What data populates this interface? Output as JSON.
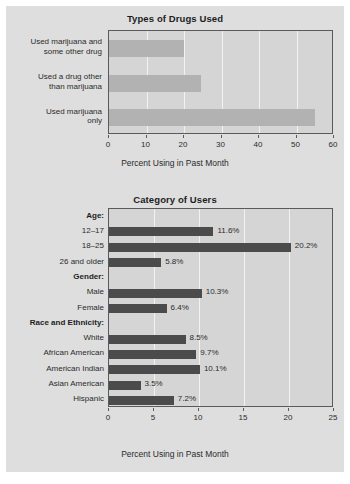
{
  "figure": {
    "background_color": "#dedede",
    "plot_background_color": "#d5d5d5",
    "frame_color": "#5a5a5a",
    "gridline_color": "#f2f2f2"
  },
  "chart_data": [
    {
      "type": "bar",
      "orientation": "horizontal",
      "title": "Types of Drugs Used",
      "xlabel": "Percent Using in Past Month",
      "ylabel": "",
      "xlim": [
        0,
        60
      ],
      "xticks": [
        0,
        10,
        20,
        30,
        40,
        50,
        60
      ],
      "xticklabels": [
        "0",
        "10",
        "20",
        "30",
        "40",
        "50",
        "60"
      ],
      "grid": true,
      "bar_color": "#b2b2b2",
      "categories": [
        "Used marijuana and\nsome other drug",
        "Used a drug other\nthan marijuana",
        "Used marijuana\nonly"
      ],
      "values": [
        19.9,
        24.6,
        55.0
      ],
      "value_labels": [
        "",
        "",
        ""
      ]
    },
    {
      "type": "bar",
      "orientation": "horizontal",
      "title": "Category of Users",
      "xlabel": "Percent Using in Past Month",
      "ylabel": "",
      "xlim": [
        0,
        25
      ],
      "xticks": [
        0,
        5,
        10,
        15,
        20,
        25
      ],
      "xticklabels": [
        "0",
        "5",
        "10",
        "15",
        "20",
        "25"
      ],
      "grid": true,
      "bar_color": "#4b4b4b",
      "rows": [
        {
          "label": "Age:",
          "group": true,
          "value": null,
          "value_label": ""
        },
        {
          "label": "12–17",
          "group": false,
          "value": 11.6,
          "value_label": "11.6%"
        },
        {
          "label": "18–25",
          "group": false,
          "value": 20.2,
          "value_label": "20.2%"
        },
        {
          "label": "26 and older",
          "group": false,
          "value": 5.8,
          "value_label": "5.8%"
        },
        {
          "label": "Gender:",
          "group": true,
          "value": null,
          "value_label": ""
        },
        {
          "label": "Male",
          "group": false,
          "value": 10.3,
          "value_label": "10.3%"
        },
        {
          "label": "Female",
          "group": false,
          "value": 6.4,
          "value_label": "6.4%"
        },
        {
          "label": "Race and Ethnicity:",
          "group": true,
          "value": null,
          "value_label": ""
        },
        {
          "label": "White",
          "group": false,
          "value": 8.5,
          "value_label": "8.5%"
        },
        {
          "label": "African American",
          "group": false,
          "value": 9.7,
          "value_label": "9.7%"
        },
        {
          "label": "American Indian",
          "group": false,
          "value": 10.1,
          "value_label": "10.1%"
        },
        {
          "label": "Asian American",
          "group": false,
          "value": 3.5,
          "value_label": "3.5%"
        },
        {
          "label": "Hispanic",
          "group": false,
          "value": 7.2,
          "value_label": "7.2%"
        }
      ]
    }
  ]
}
